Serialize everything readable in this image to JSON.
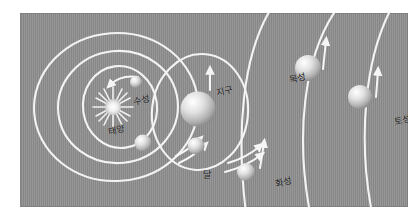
{
  "figure": {
    "panel_color": "#8e8e8e",
    "orbit_color": "#f2f2f2",
    "label_color": "#1b1b1b",
    "body_color": "#e8e8e8"
  },
  "labels": {
    "sun": "태양",
    "mercury": "수성",
    "earth": "지구",
    "moon": "달",
    "mars": "화성",
    "jupiter": "목성",
    "saturn": "토성"
  },
  "bodies": [
    {
      "name": "sun",
      "label": "태양",
      "shape": "starburst",
      "cx": 113,
      "cy": 107,
      "r": 11
    },
    {
      "name": "mercury",
      "label": "수성",
      "shape": "sphere",
      "cx": 136,
      "cy": 82,
      "r": 6
    },
    {
      "name": "venus",
      "label": "",
      "shape": "sphere",
      "cx": 143,
      "cy": 143,
      "r": 8
    },
    {
      "name": "earth",
      "label": "지구",
      "shape": "sphere",
      "cx": 198,
      "cy": 109,
      "r": 17
    },
    {
      "name": "moon",
      "label": "달",
      "shape": "sphere",
      "cx": 196,
      "cy": 146,
      "r": 8
    },
    {
      "name": "mars",
      "label": "화성",
      "shape": "sphere",
      "cx": 246,
      "cy": 172,
      "r": 9
    },
    {
      "name": "jupiter",
      "label": "목성",
      "shape": "sphere",
      "cx": 308,
      "cy": 68,
      "r": 13
    },
    {
      "name": "saturn",
      "label": "토성",
      "shape": "sphere",
      "cx": 360,
      "cy": 97,
      "r": 12
    }
  ],
  "orbits": [
    {
      "name": "mercury-orbit",
      "type": "ellipse"
    },
    {
      "name": "venus-orbit",
      "type": "ellipse"
    },
    {
      "name": "earth-orbit",
      "type": "ellipse"
    },
    {
      "name": "moon-orbit",
      "type": "ellipse"
    },
    {
      "name": "mars-orbit",
      "type": "arc"
    },
    {
      "name": "jupiter-orbit",
      "type": "arc"
    },
    {
      "name": "saturn-orbit",
      "type": "arc"
    }
  ],
  "arrows": [
    {
      "name": "mercury-direction-arrow",
      "direction": "counterclockwise"
    },
    {
      "name": "venus-direction-arrow",
      "direction": "clockwise-right"
    },
    {
      "name": "earth-direction-arrow",
      "direction": "up"
    },
    {
      "name": "moon-direction-arrow",
      "direction": "right"
    },
    {
      "name": "mars-direction-arrow",
      "direction": "up"
    },
    {
      "name": "jupiter-direction-arrow",
      "direction": "up"
    },
    {
      "name": "saturn-direction-arrow",
      "direction": "up"
    }
  ]
}
